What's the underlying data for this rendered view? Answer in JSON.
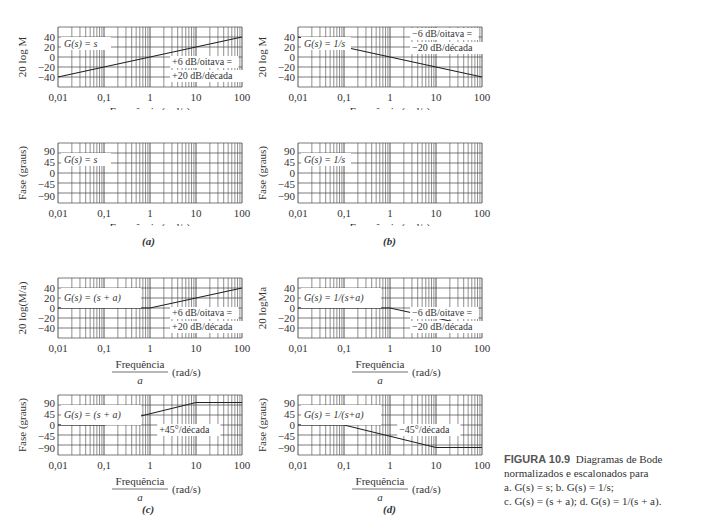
{
  "caption": {
    "figure": "FIGURA 10.9",
    "text1": "Diagramas de Bode normalizados e escalonados para",
    "line_a": "a. G(s) = s; b. G(s) = 1/s;",
    "line_c": "c. G(s) = (s + a); d. G(s) = 1/(s + a)."
  },
  "labels": {
    "a": "(a)",
    "b": "(b)",
    "c": "(c)",
    "d": "(d)"
  },
  "chart_data": [
    {
      "id": "a-mag",
      "type": "line",
      "title": "G(s) = s",
      "xlabel": "Frequência (rad/s)",
      "ylabel": "20 log M",
      "xscale": "log",
      "xlim": [
        0.01,
        100
      ],
      "ylim": [
        -60,
        60
      ],
      "yticks": [
        40,
        20,
        0,
        -20,
        -40
      ],
      "xticks": [
        "0,01",
        "0,1",
        "1",
        "10",
        "100"
      ],
      "x": [
        0.01,
        100
      ],
      "y": [
        -40,
        40
      ],
      "annotation": "+6 dB/oitava = +20 dB/década",
      "grid": true
    },
    {
      "id": "b-mag",
      "type": "line",
      "title": "G(s) = 1/s",
      "xlabel": "Frequência (rad/s)",
      "ylabel": "20 log M",
      "xscale": "log",
      "xlim": [
        0.01,
        100
      ],
      "ylim": [
        -60,
        60
      ],
      "yticks": [
        40,
        20,
        0,
        -20,
        -40
      ],
      "xticks": [
        "0,01",
        "0,1",
        "1",
        "10",
        "100"
      ],
      "x": [
        0.01,
        100
      ],
      "y": [
        40,
        -40
      ],
      "annotation": "−6 dB/oitava = −20 dB/década",
      "grid": true
    },
    {
      "id": "a-phase",
      "type": "line",
      "title": "G(s) = s",
      "xlabel": "Frequência (rad/s)",
      "ylabel": "Fase (graus)",
      "xscale": "log",
      "xlim": [
        0.01,
        100
      ],
      "ylim": [
        -120,
        120
      ],
      "yticks": [
        90,
        45,
        0,
        -45,
        -90
      ],
      "xticks": [
        "0,01",
        "0,1",
        "1",
        "10",
        "100"
      ],
      "x": [],
      "y": [],
      "grid": true
    },
    {
      "id": "b-phase",
      "type": "line",
      "title": "G(s) = 1/s",
      "xlabel": "Frequência (rad/s)",
      "ylabel": "Fase (graus)",
      "xscale": "log",
      "xlim": [
        0.01,
        100
      ],
      "ylim": [
        -120,
        120
      ],
      "yticks": [
        90,
        45,
        0,
        -45,
        -90
      ],
      "xticks": [
        "0,01",
        "0,1",
        "1",
        "10",
        "100"
      ],
      "x": [],
      "y": [],
      "grid": true
    },
    {
      "id": "c-mag",
      "type": "line",
      "title": "G(s) = (s + a)",
      "xlabel": "Frequência/a (rad/s)",
      "ylabel": "20 log(M/a)",
      "xscale": "log",
      "xlim": [
        0.01,
        100
      ],
      "ylim": [
        -60,
        60
      ],
      "yticks": [
        40,
        20,
        0,
        -20,
        -40
      ],
      "xticks": [
        "0,01",
        "0,1",
        "1",
        "10",
        "100"
      ],
      "x": [
        0.01,
        1,
        100
      ],
      "y": [
        0,
        0,
        40
      ],
      "annotation": "+6 dB/oitava = +20 dB/década",
      "grid": true
    },
    {
      "id": "d-mag",
      "type": "line",
      "title": "G(s) = 1/(s+a)",
      "xlabel": "Frequência/a (rad/s)",
      "ylabel": "20 logMa",
      "xscale": "log",
      "xlim": [
        0.01,
        100
      ],
      "ylim": [
        -60,
        60
      ],
      "yticks": [
        40,
        20,
        0,
        -20,
        -40
      ],
      "xticks": [
        "0,01",
        "0,1",
        "1",
        "10",
        "100"
      ],
      "x": [
        0.01,
        1,
        100
      ],
      "y": [
        0,
        0,
        -40
      ],
      "annotation": "−6 dB/oitave = −20 dB/década",
      "grid": true
    },
    {
      "id": "c-phase",
      "type": "line",
      "title": "G(s) = (s + a)",
      "xlabel": "Frequência/a (rad/s)",
      "ylabel": "Fase (graus)",
      "xscale": "log",
      "xlim": [
        0.01,
        100
      ],
      "ylim": [
        -120,
        120
      ],
      "yticks": [
        90,
        45,
        0,
        -45,
        -90
      ],
      "xticks": [
        "0,01",
        "0,1",
        "1",
        "10",
        "100"
      ],
      "x": [
        0.01,
        0.1,
        10,
        100
      ],
      "y": [
        0,
        0,
        90,
        90
      ],
      "annotation": "+45°/década",
      "grid": true
    },
    {
      "id": "d-phase",
      "type": "line",
      "title": "G(s) = 1/(s+a)",
      "xlabel": "Frequência/a (rad/s)",
      "ylabel": "Fase (graus)",
      "xscale": "log",
      "xlim": [
        0.01,
        100
      ],
      "ylim": [
        -120,
        120
      ],
      "yticks": [
        90,
        45,
        0,
        -45,
        -90
      ],
      "xticks": [
        "0,01",
        "0,1",
        "1",
        "10",
        "100"
      ],
      "x": [
        0.01,
        0.1,
        10,
        100
      ],
      "y": [
        0,
        0,
        -90,
        -90
      ],
      "annotation": "−45°/década",
      "grid": true
    }
  ]
}
